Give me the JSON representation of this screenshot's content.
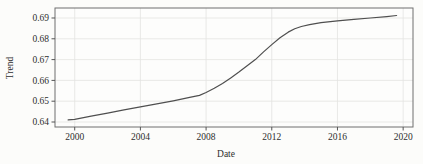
{
  "chart_data": {
    "type": "line",
    "title": "",
    "xlabel": "Date",
    "ylabel": "Trend",
    "grid": true,
    "legend": "none",
    "xlim": [
      1998.8,
      2020.6
    ],
    "ylim": [
      0.6376,
      0.6948
    ],
    "x_ticks": {
      "values": [
        2000,
        2004,
        2008,
        2012,
        2016,
        2020
      ],
      "labels": [
        "2000",
        "2004",
        "2008",
        "2012",
        "2016",
        "2020"
      ]
    },
    "y_ticks": {
      "values": [
        0.64,
        0.65,
        0.66,
        0.67,
        0.68,
        0.69
      ],
      "labels": [
        "0.64",
        "0.65",
        "0.66",
        "0.67",
        "0.68",
        "0.69"
      ]
    },
    "series": [
      {
        "name": "Trend",
        "x": [
          1999.6,
          2000,
          2001,
          2002,
          2003,
          2004,
          2005,
          2006,
          2007,
          2007.6,
          2008,
          2008.5,
          2009,
          2009.5,
          2010,
          2010.5,
          2011,
          2011.5,
          2012,
          2012.5,
          2013,
          2013.4,
          2013.8,
          2014.3,
          2015,
          2016,
          2017,
          2018,
          2019,
          2019.6
        ],
        "values": [
          0.641,
          0.6413,
          0.6428,
          0.6443,
          0.6458,
          0.6473,
          0.6487,
          0.6502,
          0.6518,
          0.6528,
          0.6542,
          0.6562,
          0.6585,
          0.6612,
          0.664,
          0.667,
          0.67,
          0.6737,
          0.6772,
          0.6805,
          0.6832,
          0.6848,
          0.6859,
          0.6868,
          0.6878,
          0.6886,
          0.6893,
          0.69,
          0.6907,
          0.6912
        ]
      }
    ],
    "colors": {
      "line": "#4f4f4f",
      "grid": "#e3e3e1",
      "spine": "#6f6f6f",
      "tick": "#555555",
      "text": "#2e2e2e",
      "plot_background": "#fdfdfc"
    }
  }
}
